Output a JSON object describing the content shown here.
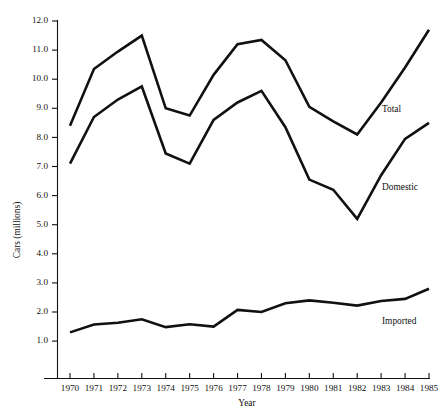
{
  "chart_data": {
    "type": "line",
    "title": "",
    "xlabel": "Year",
    "ylabel": "Cars (millions)",
    "x": [
      1970,
      1971,
      1972,
      1973,
      1974,
      1975,
      1976,
      1977,
      1978,
      1979,
      1980,
      1981,
      1982,
      1983,
      1984,
      1985
    ],
    "categories": [
      "1970",
      "1971",
      "1972",
      "1973",
      "1974",
      "1975",
      "1976",
      "1977",
      "1978",
      "1979",
      "1980",
      "1981",
      "1982",
      "1983",
      "1984",
      "1985"
    ],
    "xlim": [
      1970,
      1985
    ],
    "ylim": [
      0.4,
      12.0
    ],
    "yticks": [
      1.0,
      2.0,
      3.0,
      4.0,
      5.0,
      6.0,
      7.0,
      8.0,
      9.0,
      10.0,
      11.0,
      12.0
    ],
    "ytick_labels": [
      "1.0",
      "2.0",
      "3.0",
      "4.0",
      "5.0",
      "6.0",
      "7.0",
      "8.0",
      "9.0",
      "10.0",
      "11.0",
      "12.0"
    ],
    "grid": false,
    "legend_position": "inline-right-of-series",
    "series": [
      {
        "name": "Total",
        "label": "Total",
        "color": "#111111",
        "values": [
          8.4,
          10.35,
          10.95,
          11.5,
          9.0,
          8.75,
          10.15,
          11.2,
          11.35,
          10.65,
          9.05,
          8.55,
          8.1,
          9.2,
          10.4,
          11.7
        ]
      },
      {
        "name": "Domestic",
        "label": "Domestic",
        "color": "#111111",
        "values": [
          7.1,
          8.7,
          9.3,
          9.75,
          7.45,
          7.1,
          8.6,
          9.2,
          9.6,
          8.35,
          6.55,
          6.2,
          5.2,
          6.7,
          7.95,
          8.5
        ]
      },
      {
        "name": "Imported",
        "label": "Imported",
        "color": "#111111",
        "values": [
          1.3,
          1.57,
          1.63,
          1.75,
          1.48,
          1.58,
          1.5,
          2.07,
          2.0,
          2.3,
          2.4,
          2.32,
          2.22,
          2.38,
          2.45,
          2.8
        ]
      }
    ],
    "series_label_positions": [
      {
        "name": "Total",
        "x": 382,
        "y": 110
      },
      {
        "name": "Domestic",
        "x": 382,
        "y": 188
      },
      {
        "name": "Imported",
        "x": 382,
        "y": 322
      }
    ]
  }
}
